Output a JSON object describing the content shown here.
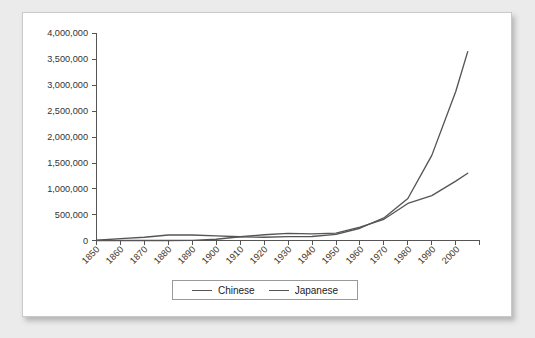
{
  "chart_data": {
    "type": "line",
    "title": "",
    "subtitle": "",
    "xlabel": "",
    "ylabel": "",
    "xlim": [
      1850,
      2010
    ],
    "ylim": [
      0,
      4000000
    ],
    "grid": false,
    "legend_position": "bottom-center",
    "x_tick_labels": [
      "1850",
      "1860",
      "1870",
      "1880",
      "1890",
      "1900",
      "1910",
      "1920",
      "1930",
      "1940",
      "1950",
      "1960",
      "1970",
      "1980",
      "1990",
      "2000"
    ],
    "y_tick_labels": [
      "0",
      "500,000",
      "1,000,000",
      "1,500,000",
      "2,000,000",
      "2,500,000",
      "3,000,000",
      "3,500,000",
      "4,000,000"
    ],
    "y_tick_values": [
      0,
      500000,
      1000000,
      1500000,
      2000000,
      2500000,
      3000000,
      3500000,
      4000000
    ],
    "x": [
      1850,
      1860,
      1870,
      1880,
      1890,
      1900,
      1910,
      1920,
      1930,
      1940,
      1950,
      1960,
      1970,
      1980,
      1990,
      2000,
      2005
    ],
    "series": [
      {
        "name": "Chinese",
        "color": "#555555",
        "values": [
          4000,
          35000,
          63000,
          106000,
          107000,
          90000,
          72000,
          62000,
          75000,
          78000,
          118000,
          237000,
          436000,
          812000,
          1645000,
          2880000,
          3650000
        ]
      },
      {
        "name": "Japanese",
        "color": "#555555",
        "values": [
          0,
          0,
          0,
          0,
          2000,
          24000,
          72000,
          111000,
          139000,
          127000,
          142000,
          260000,
          410000,
          716000,
          866000,
          1148000,
          1300000
        ]
      }
    ],
    "legend": [
      "Chinese",
      "Japanese"
    ]
  },
  "legend": {
    "entries": [
      {
        "label": "Chinese"
      },
      {
        "label": "Japanese"
      }
    ]
  }
}
